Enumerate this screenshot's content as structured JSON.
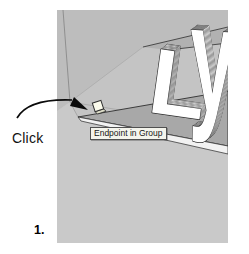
{
  "figure": {
    "step_label": "1.",
    "click_label": "Click",
    "tooltip_text": "Endpoint in Group",
    "text_3d": "Ly",
    "letters": [
      "L",
      "y"
    ],
    "colors": {
      "page_bg": "#ffffff",
      "wall_base": "#c4c4c4",
      "wall_upper": "#bdbdbd",
      "wall_band": "#b1b1b1",
      "floor": "#c9c9c9",
      "plate_top": "#a8a8a8",
      "plate_edge": "#f2f2f2",
      "letter_face": "#ffffff",
      "letter_side": "#d6d6d6",
      "tooltip_bg": "#f4f4ec",
      "marker_fill": "#fbfbec",
      "marker_side": "#ddddc8",
      "arrow_color": "#0a0a0a"
    }
  }
}
